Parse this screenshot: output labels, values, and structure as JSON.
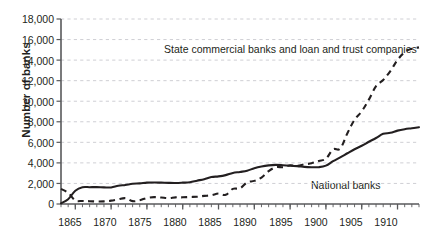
{
  "chart_data": {
    "type": "line",
    "title": "",
    "subtitle": "",
    "xlabel": "",
    "ylabel": "Number of banks",
    "xlim": [
      1863,
      1913
    ],
    "ylim": [
      0,
      18000
    ],
    "grid": true,
    "grid_axis": "y",
    "legend_position": "inline-annotations",
    "y_ticks": [
      0,
      2000,
      4000,
      6000,
      8000,
      10000,
      12000,
      14000,
      16000,
      18000
    ],
    "y_tick_labels": [
      "0",
      "2,000",
      "4,000",
      "6,000",
      "8,000",
      "10,000",
      "12,000",
      "14,000",
      "16,000",
      "18,000"
    ],
    "x_ticks": [
      1865,
      1870,
      1875,
      1880,
      1885,
      1890,
      1895,
      1900,
      1905,
      1910
    ],
    "x_tick_labels": [
      "1865",
      "1870",
      "1875",
      "1880",
      "1885",
      "1890",
      "1895",
      "1900",
      "1905",
      "1910"
    ],
    "x_minor_tick_interval": 1,
    "x": [
      1863,
      1864,
      1865,
      1866,
      1867,
      1868,
      1869,
      1870,
      1871,
      1872,
      1873,
      1874,
      1875,
      1876,
      1877,
      1878,
      1879,
      1880,
      1881,
      1882,
      1883,
      1884,
      1885,
      1886,
      1887,
      1888,
      1889,
      1890,
      1891,
      1892,
      1893,
      1894,
      1895,
      1896,
      1897,
      1898,
      1899,
      1900,
      1901,
      1902,
      1903,
      1904,
      1905,
      1906,
      1907,
      1908,
      1909,
      1910,
      1911,
      1912,
      1913
    ],
    "series": [
      {
        "name": "National banks",
        "style": "solid",
        "color": "#231f20",
        "label_text": "National banks",
        "values": [
          66,
          467,
          1294,
          1634,
          1636,
          1640,
          1619,
          1612,
          1767,
          1853,
          1968,
          2004,
          2076,
          2091,
          2078,
          2056,
          2048,
          2076,
          2115,
          2269,
          2417,
          2625,
          2689,
          2809,
          3014,
          3120,
          3239,
          3484,
          3652,
          3759,
          3807,
          3770,
          3715,
          3689,
          3610,
          3582,
          3583,
          3731,
          4165,
          4535,
          4939,
          5331,
          5664,
          6053,
          6422,
          6824,
          6926,
          7138,
          7277,
          7372,
          7473
        ]
      },
      {
        "name": "State commercial banks and loan and trust companies",
        "style": "dashed",
        "color": "#231f20",
        "label_text": "State commercial banks and loan and trust companies",
        "values": [
          1466,
          1089,
          349,
          297,
          272,
          247,
          259,
          325,
          452,
          566,
          277,
          368,
          586,
          671,
          631,
          575,
          648,
          650,
          683,
          704,
          788,
          852,
          1015,
          891,
          1471,
          1523,
          2101,
          2250,
          2572,
          3191,
          3579,
          3586,
          3774,
          3708,
          3857,
          3965,
          4191,
          4405,
          5317,
          5397,
          6891,
          8199,
          9018,
          10155,
          11469,
          12062,
          12936,
          14011,
          14770,
          15100,
          15240
        ]
      }
    ],
    "annotations": [
      {
        "text": "State commercial banks and loan and trust companies",
        "series": "state"
      },
      {
        "text": "National banks",
        "series": "national"
      }
    ],
    "colors": {
      "axis": "#58595b",
      "grid": "#c9c9cf",
      "line": "#231f20",
      "text": "#231f20",
      "background": "#ffffff"
    }
  }
}
